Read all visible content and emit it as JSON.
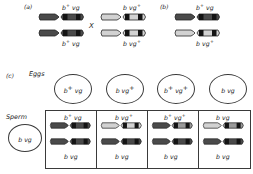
{
  "figure": {
    "panels": [
      {
        "id": "a",
        "label": "(a)"
      },
      {
        "id": "b",
        "label": "(b)"
      },
      {
        "id": "c",
        "label": "(c)"
      }
    ],
    "cross_symbol": "X"
  },
  "colors": {
    "dark_chromosome": "#4a4a4a",
    "light_chromosome": "#d0d0d0",
    "band_dark": "#1c1c1c",
    "band_mid": "#8c8c8c",
    "outline": "#2a2a2a",
    "text": "#1a1a1a",
    "background": "#ffffff"
  },
  "panel_a": {
    "label": "(a)",
    "parent_left": {
      "name": "female-parent",
      "top_chromosome": {
        "shade": "dark",
        "label_b": "b",
        "label_b_sup": "+",
        "label_vg": "vg",
        "label_vg_sup": ""
      },
      "bottom_chromosome": {
        "shade": "dark",
        "label_b": "b",
        "label_b_sup": "+",
        "label_vg": "vg",
        "label_vg_sup": ""
      },
      "top_label": "b+ vg",
      "bottom_label": "b+ vg"
    },
    "cross_symbol": "X",
    "parent_right": {
      "name": "male-parent",
      "top_chromosome": {
        "shade": "light",
        "label_b": "b",
        "label_b_sup": "",
        "label_vg": "vg",
        "label_vg_sup": "+"
      },
      "bottom_chromosome": {
        "shade": "light",
        "label_b": "b",
        "label_b_sup": "",
        "label_vg": "vg",
        "label_vg_sup": "+"
      },
      "top_label": "b vg+",
      "bottom_label": "b vg+"
    }
  },
  "panel_b": {
    "label": "(b)",
    "f1_individual": {
      "name": "f1-heterozygote",
      "top_chromosome": {
        "shade": "dark",
        "label_b": "b",
        "label_b_sup": "+",
        "label_vg": "vg",
        "label_vg_sup": ""
      },
      "bottom_chromosome": {
        "shade": "light",
        "label_b": "b",
        "label_b_sup": "",
        "label_vg": "vg",
        "label_vg_sup": "+"
      },
      "top_label": "b+ vg",
      "bottom_label": "b vg+"
    }
  },
  "panel_c": {
    "label": "(c)",
    "eggs_label": "Eggs",
    "sperm_label": "Sperm",
    "sperm_gamete": {
      "name": "sperm-gamete",
      "b": "b",
      "b_sup": "",
      "vg": "vg",
      "vg_sup": "",
      "text": "b vg"
    },
    "eggs": [
      {
        "name": "egg-gamete-1",
        "b": "b",
        "b_sup": "+",
        "vg": "vg",
        "vg_sup": "",
        "text": "b+ vg",
        "type": "parental"
      },
      {
        "name": "egg-gamete-2",
        "b": "b",
        "b_sup": "",
        "vg": "vg",
        "vg_sup": "+",
        "text": "b vg+",
        "type": "parental"
      },
      {
        "name": "egg-gamete-3",
        "b": "b",
        "b_sup": "+",
        "vg": "vg",
        "vg_sup": "+",
        "text": "b+ vg+",
        "type": "recombinant"
      },
      {
        "name": "egg-gamete-4",
        "b": "b",
        "b_sup": "",
        "vg": "vg",
        "vg_sup": "",
        "text": "b vg",
        "type": "recombinant"
      }
    ],
    "offspring": [
      {
        "name": "offspring-1",
        "top": {
          "shade": "dark",
          "b": "b",
          "b_sup": "+",
          "vg": "vg",
          "vg_sup": "",
          "text": "b+ vg"
        },
        "bottom": {
          "shade": "dark",
          "b": "b",
          "b_sup": "",
          "vg": "vg",
          "vg_sup": "",
          "text": "b vg"
        }
      },
      {
        "name": "offspring-2",
        "top": {
          "shade": "light",
          "b": "b",
          "b_sup": "",
          "vg": "vg",
          "vg_sup": "+",
          "text": "b vg+"
        },
        "bottom": {
          "shade": "dark",
          "b": "b",
          "b_sup": "",
          "vg": "vg",
          "vg_sup": "",
          "text": "b vg"
        }
      },
      {
        "name": "offspring-3",
        "top": {
          "shade": "mixed",
          "b": "b",
          "b_sup": "+",
          "vg": "vg",
          "vg_sup": "+",
          "text": "b+ vg+"
        },
        "bottom": {
          "shade": "dark",
          "b": "b",
          "b_sup": "",
          "vg": "vg",
          "vg_sup": "",
          "text": "b vg"
        }
      },
      {
        "name": "offspring-4",
        "top": {
          "shade": "light",
          "b": "b",
          "b_sup": "",
          "vg": "vg",
          "vg_sup": "",
          "text": "b vg"
        },
        "bottom": {
          "shade": "dark",
          "b": "b",
          "b_sup": "",
          "vg": "vg",
          "vg_sup": "",
          "text": "b vg"
        }
      }
    ]
  }
}
